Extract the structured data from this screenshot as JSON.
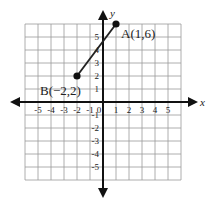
{
  "chart_data": {
    "type": "scatter",
    "title": "",
    "xlabel": "x",
    "ylabel": "y",
    "xlim": [
      -6,
      6
    ],
    "ylim": [
      -6,
      6
    ],
    "grid": true,
    "x_ticks": [
      "-5",
      "-4",
      "-3",
      "-2",
      "-1",
      "0",
      "1",
      "2",
      "3",
      "4",
      "5"
    ],
    "y_ticks": [
      "5",
      "4",
      "3",
      "2",
      "1",
      "-1",
      "-2",
      "-3",
      "-4",
      "-5"
    ],
    "points": [
      {
        "name": "A",
        "x": 1,
        "y": 6,
        "label": "A(1,6)"
      },
      {
        "name": "B",
        "x": -2,
        "y": 2,
        "label": "B(−2,2)"
      }
    ],
    "segments": [
      {
        "from": "B",
        "to": "A"
      }
    ]
  },
  "labels": {
    "x_axis": "x",
    "y_axis": "y",
    "point_a": "A(1,6)",
    "point_b": "B(−2,2)",
    "x_ticks": [
      "-5",
      "-4",
      "-3",
      "-2",
      "-1",
      "0",
      "1",
      "2",
      "3",
      "4",
      "5"
    ],
    "y_ticks_pos": [
      "5",
      "4",
      "3",
      "2",
      "1"
    ],
    "y_ticks_neg": [
      "-1",
      "-2",
      "-3",
      "-4",
      "-5"
    ]
  }
}
